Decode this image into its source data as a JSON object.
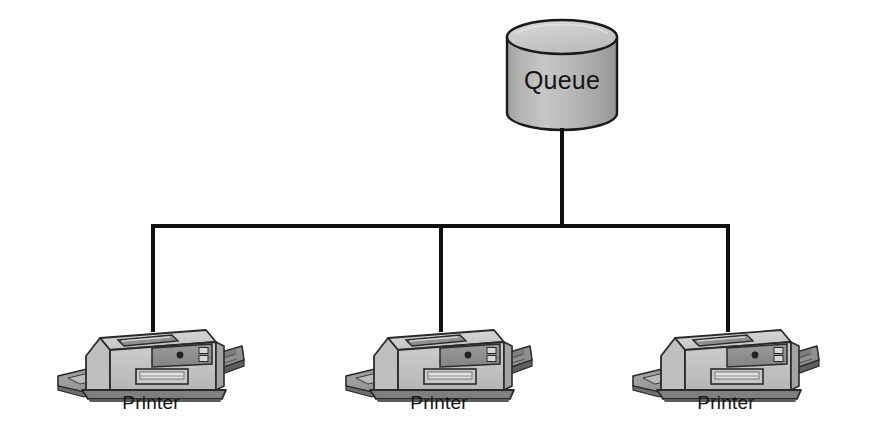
{
  "diagram": {
    "type": "bus-tree",
    "background_color": "#ffffff",
    "line_color": "#101010",
    "line_width": 4,
    "queue": {
      "label": "Queue",
      "shape": "cylinder",
      "icon_name": "database-cylinder-icon",
      "center_x": 562,
      "top_y": 20,
      "bottom_y": 130,
      "radius_x": 55,
      "ellipse_ry": 17,
      "body_fill": "#b4b4b4",
      "top_fill": "#c9c9c9",
      "outline_color": "#1a1a1a",
      "label_color": "#151515",
      "label_font_size": 25
    },
    "bus": {
      "y": 226,
      "x_start": 153,
      "x_end": 728,
      "stem_from_queue_x": 562,
      "stem_top_y": 128,
      "stem_bottom_y": 226
    },
    "nodes": [
      {
        "label": "Printer",
        "icon_name": "printer-icon",
        "drop_x": 153,
        "drop_top_y": 226,
        "drop_bottom_y": 330,
        "body_center_x": 151,
        "body_top_y": 316,
        "label_x": 151,
        "label_y": 409
      },
      {
        "label": "Printer",
        "icon_name": "printer-icon",
        "drop_x": 441,
        "drop_top_y": 226,
        "drop_bottom_y": 330,
        "body_center_x": 439,
        "body_top_y": 316,
        "label_x": 439,
        "label_y": 409
      },
      {
        "label": "Printer",
        "icon_name": "printer-icon",
        "drop_x": 728,
        "drop_top_y": 226,
        "drop_bottom_y": 330,
        "body_center_x": 726,
        "body_top_y": 316,
        "label_x": 726,
        "label_y": 409
      }
    ],
    "printer_style": {
      "body_fill": "#c4c4c4",
      "body_top_fill": "#d6d6d6",
      "body_side_fill": "#a8a8a8",
      "panel_fill": "#8d8d8d",
      "tray_fill": "#9a9a9a",
      "tray_dark_fill": "#6f6f6f",
      "base_fill": "#7d7d7d",
      "outline_color": "#2a2a2a",
      "label_color": "#151515",
      "label_font_size": 19
    }
  }
}
